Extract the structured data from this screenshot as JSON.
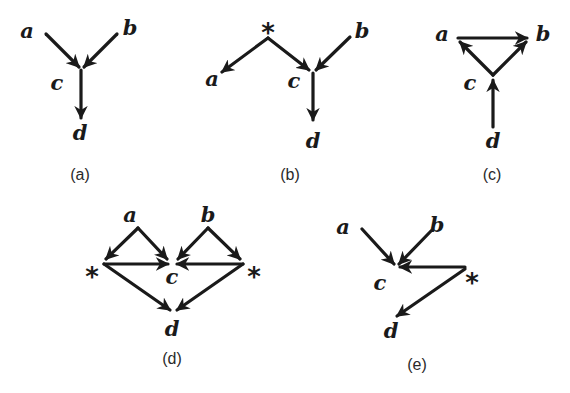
{
  "figure": {
    "panels": [
      {
        "id": "a",
        "caption": "(a)",
        "nodes": [
          {
            "name": "a",
            "label": "a",
            "x": 27,
            "y": 38
          },
          {
            "name": "b",
            "label": "b",
            "x": 130,
            "y": 35
          },
          {
            "name": "c",
            "label": "c",
            "x": 57,
            "y": 90
          },
          {
            "name": "d",
            "label": "d",
            "x": 80,
            "y": 140
          }
        ],
        "edges": [
          {
            "from": "a",
            "to": "c",
            "x1": 46,
            "y1": 34,
            "x2": 79,
            "y2": 67
          },
          {
            "from": "b",
            "to": "c",
            "x1": 117,
            "y1": 34,
            "x2": 84,
            "y2": 67
          },
          {
            "from": "c",
            "to": "d",
            "x1": 81,
            "y1": 70,
            "x2": 81,
            "y2": 118
          }
        ],
        "caption_pos": {
          "x": 80,
          "y": 180
        }
      },
      {
        "id": "b",
        "caption": "(b)",
        "nodes": [
          {
            "name": "star",
            "label": "*",
            "x": 268,
            "y": 32,
            "latent": true
          },
          {
            "name": "a",
            "label": "a",
            "x": 212,
            "y": 86
          },
          {
            "name": "b",
            "label": "b",
            "x": 362,
            "y": 38
          },
          {
            "name": "c",
            "label": "c",
            "x": 294,
            "y": 88
          },
          {
            "name": "d",
            "label": "d",
            "x": 313,
            "y": 148
          }
        ],
        "edges": [
          {
            "from": "star",
            "to": "a",
            "x1": 268,
            "y1": 38,
            "x2": 222,
            "y2": 72
          },
          {
            "from": "star",
            "to": "c",
            "x1": 268,
            "y1": 38,
            "x2": 309,
            "y2": 70
          },
          {
            "from": "b",
            "to": "c",
            "x1": 350,
            "y1": 37,
            "x2": 316,
            "y2": 70
          },
          {
            "from": "c",
            "to": "d",
            "x1": 313,
            "y1": 73,
            "x2": 313,
            "y2": 120
          }
        ],
        "caption_pos": {
          "x": 290,
          "y": 180
        }
      },
      {
        "id": "c",
        "caption": "(c)",
        "nodes": [
          {
            "name": "a",
            "label": "a",
            "x": 442,
            "y": 41
          },
          {
            "name": "b",
            "label": "b",
            "x": 543,
            "y": 41
          },
          {
            "name": "c",
            "label": "c",
            "x": 470,
            "y": 90
          },
          {
            "name": "d",
            "label": "d",
            "x": 493,
            "y": 148
          }
        ],
        "edges": [
          {
            "from": "a",
            "to": "b",
            "x1": 458,
            "y1": 38,
            "x2": 527,
            "y2": 38
          },
          {
            "from": "c",
            "to": "a",
            "x1": 493,
            "y1": 75,
            "x2": 460,
            "y2": 42
          },
          {
            "from": "c",
            "to": "b",
            "x1": 493,
            "y1": 75,
            "x2": 526,
            "y2": 42
          },
          {
            "from": "d",
            "to": "c",
            "x1": 493,
            "y1": 127,
            "x2": 493,
            "y2": 80
          }
        ],
        "caption_pos": {
          "x": 492,
          "y": 180
        }
      },
      {
        "id": "d",
        "caption": "(d)",
        "nodes": [
          {
            "name": "a",
            "label": "a",
            "x": 130,
            "y": 222
          },
          {
            "name": "b",
            "label": "b",
            "x": 208,
            "y": 222
          },
          {
            "name": "star-left",
            "label": "*",
            "x": 92,
            "y": 276,
            "latent": true
          },
          {
            "name": "star-right",
            "label": "*",
            "x": 254,
            "y": 276,
            "latent": true
          },
          {
            "name": "c",
            "label": "c",
            "x": 172,
            "y": 284
          },
          {
            "name": "d",
            "label": "d",
            "x": 172,
            "y": 336
          }
        ],
        "edges": [
          {
            "from": "a",
            "to": "star-left",
            "x1": 138,
            "y1": 228,
            "x2": 106,
            "y2": 259
          },
          {
            "from": "a",
            "to": "c",
            "x1": 138,
            "y1": 228,
            "x2": 167,
            "y2": 259
          },
          {
            "from": "b",
            "to": "c",
            "x1": 208,
            "y1": 228,
            "x2": 178,
            "y2": 259
          },
          {
            "from": "b",
            "to": "star-right",
            "x1": 208,
            "y1": 228,
            "x2": 240,
            "y2": 259
          },
          {
            "from": "star-left",
            "to": "c",
            "x1": 104,
            "y1": 264,
            "x2": 168,
            "y2": 264
          },
          {
            "from": "star-right",
            "to": "c",
            "x1": 243,
            "y1": 264,
            "x2": 177,
            "y2": 264
          },
          {
            "from": "star-left",
            "to": "d",
            "x1": 104,
            "y1": 264,
            "x2": 170,
            "y2": 310
          },
          {
            "from": "star-right",
            "to": "d",
            "x1": 243,
            "y1": 264,
            "x2": 177,
            "y2": 310
          }
        ],
        "caption_pos": {
          "x": 172,
          "y": 364
        }
      },
      {
        "id": "e",
        "caption": "(e)",
        "nodes": [
          {
            "name": "a",
            "label": "a",
            "x": 343,
            "y": 234
          },
          {
            "name": "b",
            "label": "b",
            "x": 437,
            "y": 232
          },
          {
            "name": "c",
            "label": "c",
            "x": 380,
            "y": 290
          },
          {
            "name": "star",
            "label": "*",
            "x": 472,
            "y": 282,
            "latent": true
          },
          {
            "name": "d",
            "label": "d",
            "x": 391,
            "y": 338
          }
        ],
        "edges": [
          {
            "from": "a",
            "to": "c",
            "x1": 362,
            "y1": 229,
            "x2": 394,
            "y2": 264
          },
          {
            "from": "b",
            "to": "c",
            "x1": 431,
            "y1": 231,
            "x2": 399,
            "y2": 264
          },
          {
            "from": "star",
            "to": "c",
            "x1": 465,
            "y1": 267,
            "x2": 400,
            "y2": 267
          },
          {
            "from": "star",
            "to": "d",
            "x1": 465,
            "y1": 269,
            "x2": 397,
            "y2": 316
          }
        ],
        "caption_pos": {
          "x": 417,
          "y": 370
        }
      }
    ]
  }
}
